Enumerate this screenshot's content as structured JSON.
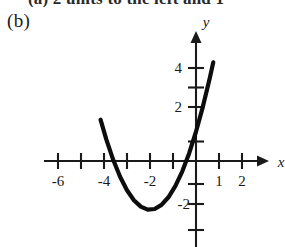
{
  "figure": {
    "part_label": "(b)",
    "clipped_header_text": "(a)   2 units to the left and 1",
    "background_color": "#ffffff",
    "ink_color": "#0d0d0d"
  },
  "chart_data": {
    "type": "line",
    "title": "",
    "subtitle": "",
    "xlabel": "x",
    "ylabel": "y",
    "function_label": "y = (x + 2)^2 - 2.5",
    "grid": false,
    "legend": "none",
    "xlim": [
      -6.7,
      2.9
    ],
    "ylim": [
      -3.6,
      4.9
    ],
    "xticks": [
      -6,
      -5,
      -4,
      -3,
      -2,
      -1,
      1,
      2
    ],
    "yticks": [
      1,
      2,
      3,
      4,
      -1,
      -2,
      -3
    ],
    "xtick_labels": [
      "-6",
      "",
      "-4",
      "",
      "-2",
      "",
      "1",
      "2"
    ],
    "ytick_labels": [
      "",
      "2",
      "",
      "4",
      "",
      "-2",
      ""
    ],
    "visible_xtick_labels": [
      "-6",
      "-4",
      "-2",
      "1",
      "2"
    ],
    "visible_ytick_labels": [
      "4",
      "2",
      "-2"
    ],
    "vertex": [
      -2,
      -2.5
    ],
    "x_intercepts": [
      -3.58,
      -0.42
    ],
    "y_intercept": 1.5,
    "x": [
      -4.15,
      -3.9,
      -3.6,
      -3.3,
      -3.0,
      -2.7,
      -2.4,
      -2.1,
      -1.8,
      -1.5,
      -1.2,
      -0.9,
      -0.6,
      -0.3,
      0,
      0.3,
      0.6,
      0.75
    ],
    "y": [
      2.12,
      1.11,
      0.06,
      -0.81,
      -1.5,
      -2.01,
      -2.34,
      -2.49,
      -2.46,
      -2.25,
      -1.86,
      -1.29,
      -0.54,
      0.39,
      1.5,
      2.79,
      4.26,
      5.06
    ]
  }
}
